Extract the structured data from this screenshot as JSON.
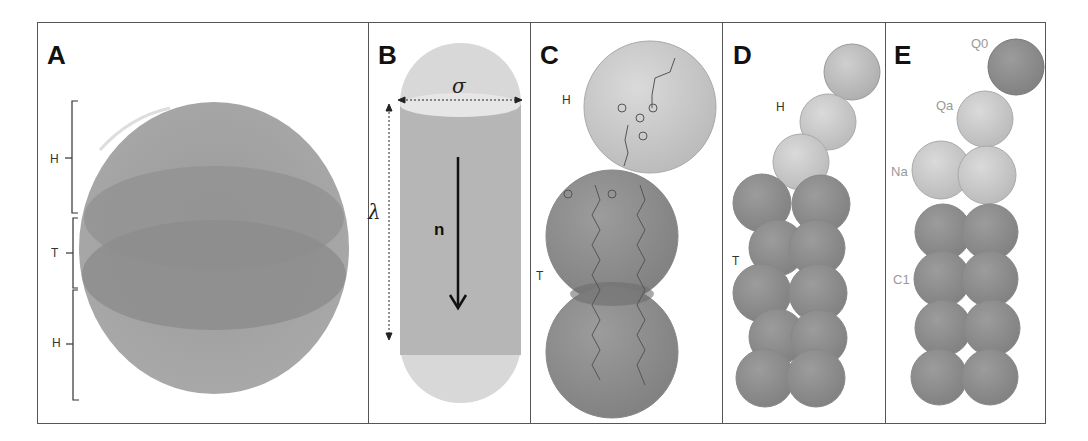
{
  "panels": [
    {
      "id": "A",
      "label": "A",
      "brackets": [
        "H",
        "T",
        "H"
      ]
    },
    {
      "id": "B",
      "label": "B",
      "symbols": {
        "width": "σ",
        "length": "λ",
        "director": "n"
      }
    },
    {
      "id": "C",
      "label": "C",
      "regions": [
        "H",
        "T"
      ]
    },
    {
      "id": "D",
      "label": "D",
      "regions": [
        "H",
        "T"
      ]
    },
    {
      "id": "E",
      "label": "E",
      "bead_types": [
        "Q0",
        "Qa",
        "Na",
        "C1"
      ]
    }
  ],
  "colors": {
    "frame": "#555555",
    "head_light": "#d2d2d2",
    "head_mid": "#bdbdbd",
    "tail_dark": "#8f8f8f",
    "sphere_outer": "#a2a2a2",
    "sphere_band": "#8c8c8c",
    "capsule_body": "#b8b8b8",
    "capsule_cap": "#d9d9d9"
  }
}
